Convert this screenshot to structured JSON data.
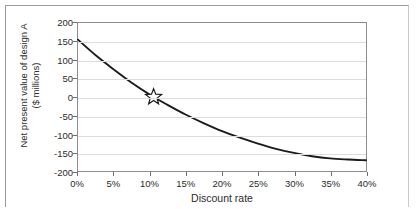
{
  "chart_data": {
    "type": "line",
    "title": "",
    "xlabel": "Discount rate",
    "ylabel_line1": "Net present value of design A",
    "ylabel_line2": "($ millions)",
    "xlim": [
      0,
      40
    ],
    "ylim": [
      -200,
      200
    ],
    "grid": true,
    "legend": "none",
    "x_tick_labels": [
      "0%",
      "5%",
      "10%",
      "15%",
      "20%",
      "25%",
      "30%",
      "35%",
      "40%"
    ],
    "x_tick_values": [
      0,
      5,
      10,
      15,
      20,
      25,
      30,
      35,
      40
    ],
    "y_tick_labels": [
      "200",
      "150",
      "100",
      "50",
      "0",
      "-50",
      "-100",
      "-150",
      "-200"
    ],
    "y_tick_values": [
      200,
      150,
      100,
      50,
      0,
      -50,
      -100,
      -150,
      -200
    ],
    "series": [
      {
        "name": "Net present value of design A",
        "color": "#1a1a1a",
        "x": [
          0,
          2.5,
          5,
          7.5,
          10,
          10.5,
          12.5,
          15,
          17.5,
          20,
          22.5,
          25,
          27.5,
          30,
          32.5,
          35,
          37.5,
          40
        ],
        "values": [
          155,
          112,
          74,
          38,
          6,
          0,
          -22,
          -48,
          -71,
          -92,
          -110,
          -126,
          -140,
          -151,
          -160,
          -166,
          -169,
          -171
        ]
      }
    ],
    "annotations": [
      {
        "marker": "star",
        "name": "irr-star-marker",
        "x": 10.5,
        "y": 0,
        "label": ""
      }
    ]
  }
}
